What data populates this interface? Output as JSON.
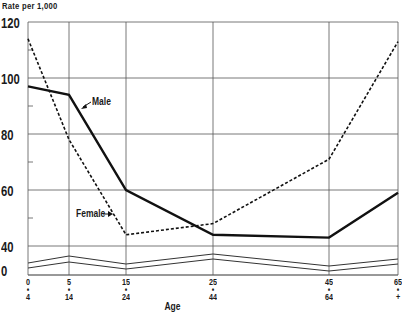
{
  "chart_data": {
    "type": "line",
    "title": "",
    "ylabel": "Rate per 1,000",
    "xlabel": "Age",
    "categories": [
      "0-4",
      "5-14",
      "15-24",
      "25-44",
      "45-64",
      "65+"
    ],
    "x_tick_labels": [
      {
        "top": "0",
        "bottom": "4"
      },
      {
        "top": "5",
        "bottom": "14"
      },
      {
        "top": "15",
        "bottom": "24"
      },
      {
        "top": "25",
        "bottom": "44"
      },
      {
        "top": "45",
        "bottom": "64"
      },
      {
        "top": "65",
        "bottom": "+"
      }
    ],
    "x_positions": [
      0,
      5,
      15,
      25,
      45,
      65
    ],
    "y_tick_labels": [
      "120",
      "100",
      "80",
      "60",
      "40",
      "0"
    ],
    "ylim": [
      0,
      120
    ],
    "axis_break": "between 0 and 40",
    "grid": true,
    "series": [
      {
        "name": "Male",
        "style": "solid",
        "values": [
          97,
          94,
          60,
          44,
          43,
          59
        ]
      },
      {
        "name": "Female",
        "style": "dashed",
        "values": [
          114,
          78,
          44,
          48,
          71,
          113
        ]
      }
    ],
    "annotations": [
      {
        "text": "Male",
        "points_to": "Male series near age 5-14"
      },
      {
        "text": "Female",
        "points_to": "Female series near age 5-14"
      }
    ]
  },
  "labels": {
    "y_title": "Rate per 1,000",
    "x_title": "Age",
    "male": "Male",
    "female": "Female"
  }
}
